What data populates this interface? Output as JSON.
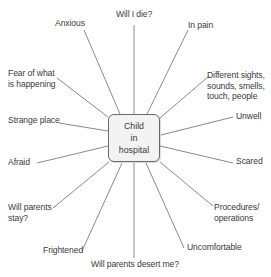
{
  "center": {
    "label": "Child\nin\nhospital"
  },
  "spokes": [
    {
      "id": "anxious",
      "label": "Anxious"
    },
    {
      "id": "will-i-die",
      "label": "Will I die?"
    },
    {
      "id": "in-pain",
      "label": "In pain"
    },
    {
      "id": "different-sights",
      "label": "Different sights,\nsounds, smells,\ntouch, people"
    },
    {
      "id": "unwell",
      "label": "Unwell"
    },
    {
      "id": "scared",
      "label": "Scared"
    },
    {
      "id": "procedures",
      "label": "Procedures/\noperations"
    },
    {
      "id": "uncomfortable",
      "label": "Uncomfortable"
    },
    {
      "id": "will-parents-desert",
      "label": "Will parents desert me?"
    },
    {
      "id": "frightened",
      "label": "Frightened"
    },
    {
      "id": "will-parents-stay",
      "label": "Will parents\nstay?"
    },
    {
      "id": "afraid",
      "label": "Afraid"
    },
    {
      "id": "strange-place",
      "label": "Strange place"
    },
    {
      "id": "fear-of-what",
      "label": "Fear of what\nis happening"
    }
  ],
  "colors": {
    "line": "#6b6b6b",
    "box_fill": "#f3f3f3",
    "box_border": "#6a6a6a",
    "text": "#3a3a3a"
  }
}
